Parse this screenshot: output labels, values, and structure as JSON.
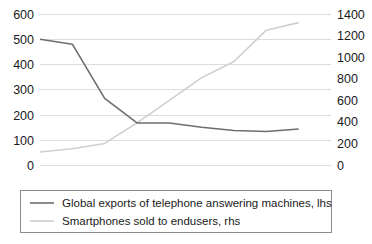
{
  "chart_data": {
    "type": "line",
    "title": "",
    "subtitle": "",
    "xlabel": "",
    "ylabel": "",
    "grid": true,
    "legend_position": "bottom",
    "dual_axis": true,
    "left_axis": {
      "label": "",
      "ticks": [
        "0",
        "100",
        "200",
        "300",
        "400",
        "500",
        "600"
      ],
      "tick_values": [
        0,
        100,
        200,
        300,
        400,
        500,
        600
      ],
      "ylim": [
        0,
        600
      ]
    },
    "right_axis": {
      "label": "",
      "ticks": [
        "0",
        "200",
        "400",
        "600",
        "800",
        "1000",
        "1200",
        "1400"
      ],
      "tick_values": [
        0,
        200,
        400,
        600,
        800,
        1000,
        1200,
        1400
      ],
      "ylim": [
        0,
        1400
      ]
    },
    "x": [
      0,
      1,
      2,
      3,
      4,
      5,
      6,
      7,
      8,
      9
    ],
    "xticks": [],
    "series": [
      {
        "name": "Global exports of telephone answering machines, lhs",
        "axis": "left",
        "color": "#6e6e6e",
        "width": 1.6,
        "values": [
          500,
          480,
          265,
          167,
          167,
          150,
          137,
          133,
          143,
          null
        ]
      },
      {
        "name": "Smartphones sold to endusers, rhs",
        "axis": "right",
        "color": "#cfcfcf",
        "width": 1.6,
        "values": [
          120,
          150,
          200,
          390,
          600,
          810,
          960,
          1250,
          1320,
          null
        ]
      }
    ],
    "annotations": []
  },
  "legend": {
    "entries": [
      {
        "label": "Global exports of telephone answering machines, lhs",
        "color": "#6e6e6e"
      },
      {
        "label": "Smartphones sold to endusers, rhs",
        "color": "#cfcfcf"
      }
    ]
  },
  "axis_left_ticks": [
    {
      "text": "600"
    },
    {
      "text": "500"
    },
    {
      "text": "400"
    },
    {
      "text": "300"
    },
    {
      "text": "200"
    },
    {
      "text": "100"
    },
    {
      "text": "0"
    }
  ],
  "axis_right_ticks": [
    {
      "text": "1400"
    },
    {
      "text": "1200"
    },
    {
      "text": "1000"
    },
    {
      "text": "800"
    },
    {
      "text": "600"
    },
    {
      "text": "400"
    },
    {
      "text": "200"
    },
    {
      "text": "0"
    }
  ]
}
